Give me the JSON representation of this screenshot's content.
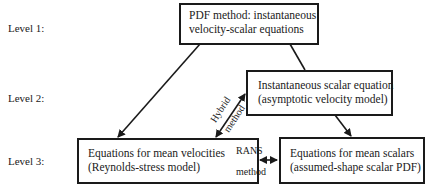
{
  "levels": [
    {
      "label": "Level 1:"
    },
    {
      "label": "Level 2:"
    },
    {
      "label": "Level 3:"
    }
  ],
  "boxes": {
    "pdf_method": {
      "line1": "PDF method: instantaneous",
      "line2": "velocity-scalar equations"
    },
    "instantaneous_scalar": {
      "line1": "Instantaneous scalar equation",
      "line2": "(asymptotic velocity model)"
    },
    "mean_velocities": {
      "line1": "Equations for mean velocities",
      "line2": "(Reynolds-stress model)"
    },
    "mean_scalars": {
      "line1": "Equations for mean scalars",
      "line2": "(assumed-shape scalar PDF)"
    }
  },
  "arrows": {
    "hybrid": {
      "line1": "Hybrid",
      "line2": "method"
    },
    "rans": {
      "line1": "RANS",
      "line2": "method"
    }
  },
  "colors": {
    "stroke": "#1a1a1a",
    "background": "#ffffff"
  }
}
